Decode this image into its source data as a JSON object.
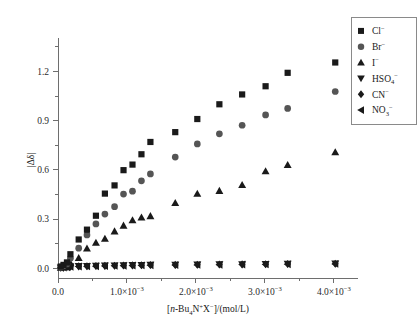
{
  "figure": {
    "background": "#ffffff",
    "marker_color_dark": "#1a1a1a",
    "marker_color_gray": "#555555",
    "axis_color": "#6e6e6e"
  },
  "axes": {
    "x_title_parts": {
      "bracket_open": "[",
      "italic_n": "n",
      "dash": "-Bu",
      "sub4": "4",
      "N": "N",
      "plus": "+",
      "X": "X",
      "minus": "−",
      "bracket_close": "]/(mol/L)"
    },
    "x_title_plain": "[n-Bu4N+X−]/(mol/L)",
    "y_title_plain": "|Δδ|",
    "x_ticks": [
      {
        "value": 0.0,
        "label_mantissa": "0.0",
        "label_exp": ""
      },
      {
        "value": 0.001,
        "label_mantissa": "1.0×10",
        "label_exp": "−3"
      },
      {
        "value": 0.002,
        "label_mantissa": "2.0×10",
        "label_exp": "−3"
      },
      {
        "value": 0.003,
        "label_mantissa": "3.0×10",
        "label_exp": "−3"
      },
      {
        "value": 0.004,
        "label_mantissa": "4.0×10",
        "label_exp": "−3"
      }
    ],
    "y_ticks": [
      {
        "value": 0.0,
        "label": "0.0"
      },
      {
        "value": 0.3,
        "label": "0.3"
      },
      {
        "value": 0.6,
        "label": "0.6"
      },
      {
        "value": 0.9,
        "label": "0.9"
      },
      {
        "value": 1.2,
        "label": "1.2"
      }
    ],
    "xlim": [
      0.0,
      0.00435
    ],
    "ylim": [
      -0.06,
      1.38
    ]
  },
  "legend": {
    "position": "top-right",
    "items": [
      {
        "marker": "square",
        "label_main": "Cl",
        "label_sub": "",
        "label_sup": "−",
        "color": "#1a1a1a"
      },
      {
        "marker": "circle",
        "label_main": "Br",
        "label_sub": "",
        "label_sup": "−",
        "color": "#555555"
      },
      {
        "marker": "triangle-up",
        "label_main": "I",
        "label_sub": "",
        "label_sup": "−",
        "color": "#1a1a1a"
      },
      {
        "marker": "triangle-down",
        "label_main": "HSO",
        "label_sub": "4",
        "label_sup": "−",
        "color": "#1a1a1a"
      },
      {
        "marker": "diamond",
        "label_main": "CN",
        "label_sub": "",
        "label_sup": "−",
        "color": "#1a1a1a"
      },
      {
        "marker": "triangle-left",
        "label_main": "NO",
        "label_sub": "3",
        "label_sup": "−",
        "color": "#1a1a1a"
      }
    ]
  },
  "chart_data": {
    "type": "scatter",
    "title": "",
    "xlabel": "[n-Bu4N+X−]/(mol/L)",
    "ylabel": "|Δδ|",
    "xlim": [
      0.0,
      0.00435
    ],
    "ylim": [
      -0.06,
      1.38
    ],
    "grid": false,
    "legend_position": "top-right",
    "series": [
      {
        "name": "Cl−",
        "marker": "square",
        "color": "#1a1a1a",
        "x": [
          4e-05,
          8e-05,
          0.00013,
          0.00018,
          0.0003,
          0.00042,
          0.00055,
          0.00068,
          0.00082,
          0.00095,
          0.00108,
          0.00121,
          0.00134,
          0.0017,
          0.00202,
          0.00234,
          0.00267,
          0.00301,
          0.00333,
          0.00402
        ],
        "y": [
          0.01,
          0.02,
          0.035,
          0.085,
          0.175,
          0.235,
          0.32,
          0.455,
          0.505,
          0.598,
          0.632,
          0.695,
          0.77,
          0.83,
          0.91,
          1.0,
          1.06,
          1.11,
          1.192,
          1.255
        ]
      },
      {
        "name": "Br−",
        "marker": "circle",
        "color": "#555555",
        "x": [
          4e-05,
          8e-05,
          0.00013,
          0.00018,
          0.0003,
          0.00042,
          0.00055,
          0.00068,
          0.00082,
          0.00095,
          0.00108,
          0.00121,
          0.00134,
          0.0017,
          0.00202,
          0.00234,
          0.00267,
          0.00301,
          0.00333,
          0.00402
        ],
        "y": [
          0.006,
          0.014,
          0.026,
          0.06,
          0.122,
          0.203,
          0.27,
          0.33,
          0.375,
          0.452,
          0.47,
          0.533,
          0.575,
          0.678,
          0.758,
          0.82,
          0.872,
          0.935,
          0.975,
          1.078
        ]
      },
      {
        "name": "I−",
        "marker": "triangle-up",
        "color": "#1a1a1a",
        "x": [
          4e-05,
          8e-05,
          0.00013,
          0.00018,
          0.0003,
          0.00042,
          0.00055,
          0.00068,
          0.00082,
          0.00095,
          0.00108,
          0.00121,
          0.00134,
          0.0017,
          0.00202,
          0.00234,
          0.00267,
          0.00301,
          0.00333,
          0.00402
        ],
        "y": [
          0.003,
          0.008,
          0.015,
          0.03,
          0.062,
          0.12,
          0.155,
          0.18,
          0.225,
          0.26,
          0.293,
          0.31,
          0.318,
          0.398,
          0.455,
          0.472,
          0.508,
          0.592,
          0.63,
          0.708
        ]
      },
      {
        "name": "HSO4−",
        "marker": "triangle-down",
        "color": "#1a1a1a",
        "x": [
          4e-05,
          8e-05,
          0.00013,
          0.00018,
          0.0003,
          0.00042,
          0.00055,
          0.00068,
          0.00082,
          0.00095,
          0.00108,
          0.00121,
          0.00134,
          0.0017,
          0.00202,
          0.00234,
          0.00267,
          0.00301,
          0.00333,
          0.00402
        ],
        "y": [
          0.004,
          0.006,
          0.008,
          0.01,
          0.012,
          0.013,
          0.014,
          0.015,
          0.016,
          0.017,
          0.018,
          0.019,
          0.02,
          0.021,
          0.022,
          0.023,
          0.024,
          0.025,
          0.026,
          0.028
        ]
      },
      {
        "name": "CN−",
        "marker": "diamond",
        "color": "#1a1a1a",
        "x": [
          4e-05,
          8e-05,
          0.00013,
          0.00018,
          0.0003,
          0.00042,
          0.00055,
          0.00068,
          0.00082,
          0.00095,
          0.00108,
          0.00121,
          0.00134,
          0.0017,
          0.00202,
          0.00234,
          0.00267,
          0.00301,
          0.00333,
          0.00402
        ],
        "y": [
          0.003,
          0.005,
          0.007,
          0.009,
          0.011,
          0.012,
          0.013,
          0.014,
          0.015,
          0.016,
          0.017,
          0.018,
          0.019,
          0.02,
          0.021,
          0.022,
          0.023,
          0.024,
          0.025,
          0.027
        ]
      },
      {
        "name": "NO3−",
        "marker": "triangle-left",
        "color": "#1a1a1a",
        "x": [
          4e-05,
          8e-05,
          0.00013,
          0.00018,
          0.0003,
          0.00042,
          0.00055,
          0.00068,
          0.00082,
          0.00095,
          0.00108,
          0.00121,
          0.00134,
          0.0017,
          0.00202,
          0.00234,
          0.00267,
          0.00301,
          0.00333,
          0.00402
        ],
        "y": [
          0.002,
          0.004,
          0.006,
          0.008,
          0.01,
          0.011,
          0.012,
          0.013,
          0.014,
          0.015,
          0.016,
          0.017,
          0.018,
          0.019,
          0.02,
          0.021,
          0.022,
          0.023,
          0.024,
          0.026
        ]
      }
    ]
  }
}
